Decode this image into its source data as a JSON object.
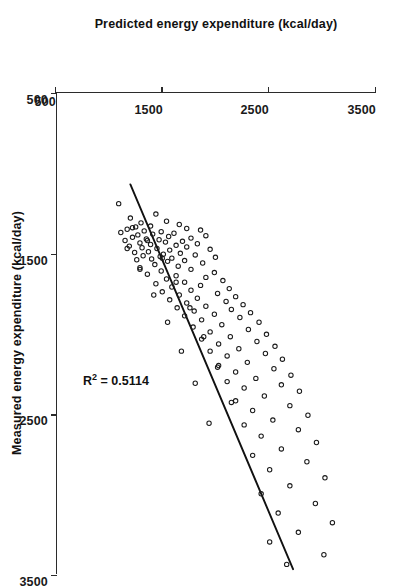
{
  "figure": {
    "orientation": "rotated-90-clockwise",
    "background_color": "#ffffff",
    "ink_color": "#1a1a1a"
  },
  "annotations": {
    "r2_prefix": "R",
    "r2_superscript": "2",
    "r2_value": " = 0.5114",
    "r2_full": "R2 = 0.5114"
  },
  "chart_data": {
    "type": "scatter",
    "title": "",
    "xlabel": "Measured energy expenditure (kcal/day)",
    "ylabel": "Predicted energy expenditure (kcal/day)",
    "xlim": [
      500,
      3500
    ],
    "ylim": [
      500,
      3500
    ],
    "xticks": [
      500,
      1500,
      2500,
      3500
    ],
    "yticks": [
      500,
      1500,
      2500,
      3500
    ],
    "xtick_labels": [
      "500",
      "1500",
      "2500",
      "3500"
    ],
    "ytick_labels": [
      "500",
      "1500",
      "2500",
      "3500"
    ],
    "grid": false,
    "legend": null,
    "r_squared": 0.5114,
    "marker": "open-circle",
    "marker_size_px": 4.4,
    "trend_line": {
      "type": "linear-fit",
      "x_start": 1070,
      "y_start": 1190,
      "x_end": 3470,
      "y_end": 2720
    },
    "x": [
      1190,
      1255,
      1280,
      1300,
      1310,
      1320,
      1330,
      1335,
      1345,
      1350,
      1355,
      1360,
      1365,
      1370,
      1375,
      1380,
      1385,
      1390,
      1395,
      1400,
      1405,
      1410,
      1415,
      1420,
      1425,
      1430,
      1435,
      1440,
      1445,
      1450,
      1455,
      1460,
      1465,
      1470,
      1475,
      1480,
      1490,
      1495,
      1500,
      1505,
      1510,
      1515,
      1520,
      1525,
      1530,
      1535,
      1540,
      1545,
      1550,
      1560,
      1570,
      1580,
      1590,
      1600,
      1610,
      1620,
      1630,
      1640,
      1650,
      1660,
      1670,
      1680,
      1690,
      1700,
      1710,
      1720,
      1730,
      1740,
      1750,
      1760,
      1770,
      1780,
      1790,
      1800,
      1810,
      1820,
      1830,
      1840,
      1850,
      1860,
      1870,
      1880,
      1890,
      1900,
      1915,
      1930,
      1945,
      1960,
      1975,
      1990,
      2005,
      2020,
      2035,
      2050,
      2065,
      2080,
      2095,
      2110,
      2125,
      2140,
      2160,
      2180,
      2200,
      2220,
      2240,
      2260,
      2280,
      2300,
      2320,
      2340,
      2360,
      2390,
      2420,
      2450,
      2480,
      2510,
      2540,
      2570,
      2600,
      2640,
      2680,
      2720,
      2760,
      2800,
      2850,
      2900,
      2950,
      3000,
      3060,
      3120,
      3180,
      3240,
      3300,
      3380,
      3440,
      1340,
      1420,
      1470,
      1530,
      1600,
      1680,
      1760,
      1840,
      1930,
      2020,
      2110,
      2210,
      2310,
      2430,
      2560
    ],
    "y": [
      1080,
      1430,
      1190,
      1530,
      1290,
      1650,
      1380,
      1240,
      1720,
      1160,
      1850,
      1320,
      1480,
      1100,
      1600,
      1400,
      1260,
      1900,
      1550,
      1210,
      1760,
      1340,
      1460,
      1140,
      1680,
      1520,
      1280,
      1820,
      1380,
      1620,
      1180,
      1720,
      1300,
      1440,
      1940,
      1560,
      1360,
      1230,
      1660,
      1500,
      1800,
      1310,
      1470,
      1990,
      1580,
      1390,
      1250,
      1700,
      1540,
      1870,
      1420,
      1640,
      1280,
      1760,
      1480,
      1980,
      1350,
      1620,
      1900,
      1530,
      2060,
      1700,
      1430,
      1850,
      1580,
      2120,
      1760,
      1490,
      2010,
      1650,
      2180,
      1820,
      1560,
      2090,
      1720,
      2250,
      1900,
      1630,
      2140,
      1790,
      2320,
      1980,
      1700,
      2220,
      1860,
      2400,
      2050,
      1780,
      2300,
      1940,
      2470,
      2130,
      1860,
      2380,
      2020,
      2550,
      2210,
      1940,
      2460,
      2100,
      2620,
      2290,
      2020,
      2540,
      2180,
      2700,
      2370,
      2100,
      2610,
      2260,
      2780,
      2450,
      2180,
      2690,
      2340,
      2860,
      2530,
      2260,
      2770,
      2420,
      2940,
      2610,
      2340,
      2850,
      2500,
      3020,
      2690,
      2420,
      2930,
      2580,
      3090,
      2770,
      2500,
      3010,
      2660,
      1210,
      1350,
      1160,
      1490,
      1280,
      1620,
      1410,
      1750,
      1540,
      1880,
      1670,
      2010,
      1800,
      2140,
      1930
    ]
  }
}
